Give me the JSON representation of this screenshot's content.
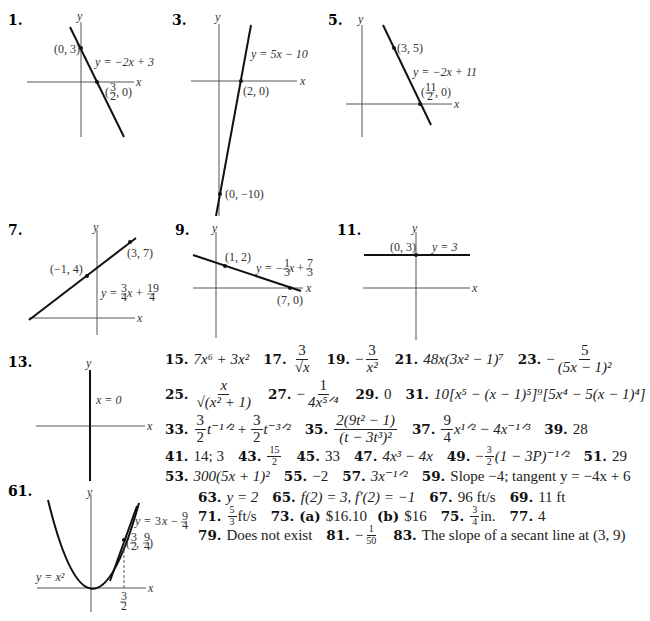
{
  "graphs": [
    {
      "number": "1.",
      "equation": "y = −2x + 3",
      "points": [
        "(0, 3)",
        "(3/2, 0)"
      ],
      "axis_x": "x",
      "axis_y": "y"
    },
    {
      "number": "3.",
      "equation": "y = 5x − 10",
      "points": [
        "(2, 0)",
        "(0, −10)"
      ],
      "axis_x": "x",
      "axis_y": "y"
    },
    {
      "number": "5.",
      "equation": "y = −2x + 11",
      "points": [
        "(3, 5)",
        "(11/2, 0)"
      ],
      "axis_x": "x",
      "axis_y": "y"
    },
    {
      "number": "7.",
      "equation": "y = 3/4 x + 19/4",
      "points": [
        "(−1, 4)",
        "(3, 7)"
      ],
      "axis_x": "x",
      "axis_y": "y"
    },
    {
      "number": "9.",
      "equation": "y = −1/3 x + 7/3",
      "points": [
        "(1, 2)",
        "(7, 0)"
      ],
      "axis_x": "x",
      "axis_y": "y"
    },
    {
      "number": "11.",
      "equation": "y = 3",
      "points": [
        "(0, 3)"
      ],
      "axis_x": "x",
      "axis_y": "y"
    },
    {
      "number": "13.",
      "equation": "x = 0",
      "points": [],
      "axis_x": "x",
      "axis_y": "y"
    },
    {
      "number": "61.",
      "equation": "y = 3x − 9/4",
      "curve": "y = x²",
      "points": [
        "(3/2, 9/4)"
      ],
      "tick": "3/2",
      "axis_x": "x",
      "axis_y": "y"
    }
  ],
  "labels": {
    "g1_pt1": "(0, 3)",
    "g1_eq": "y = −2x + 3",
    "g1_pt2_pre": "(",
    "g1_pt2_post": ", 0)",
    "g3_eq": "y = 5x − 10",
    "g3_pt1": "(2, 0)",
    "g3_pt2": "(0, −10)",
    "g5_pt1": "(3, 5)",
    "g5_eq": "y = −2x + 11",
    "g7_pt1": "(−1, 4)",
    "g7_pt2": "(3, 7)",
    "g9_pt1": "(1, 2)",
    "g9_pt2": "(7, 0)",
    "g11_pt1": "(0, 3)",
    "g11_eq": "y = 3",
    "g13_eq": "x = 0",
    "g61_curve": "y = x²",
    "x": "x",
    "y": "y",
    "n1": "1.",
    "n3": "3.",
    "n5": "5.",
    "n7": "7.",
    "n9": "9.",
    "n11": "11.",
    "n13": "13.",
    "n61": "61."
  },
  "answers": {
    "15": {
      "num": "15.",
      "text": "7x⁶ + 3x²"
    },
    "17": {
      "num": "17.",
      "top": "3",
      "bottom": "√x"
    },
    "19": {
      "num": "19.",
      "sign": "−",
      "top": "3",
      "bottom": "x²"
    },
    "21": {
      "num": "21.",
      "text": "48x(3x² − 1)⁷"
    },
    "23": {
      "num": "23.",
      "sign": "−",
      "top": "5",
      "bottom": "(5x − 1)²"
    },
    "25": {
      "num": "25.",
      "top": "x",
      "bottom": "√(x² + 1)"
    },
    "27": {
      "num": "27.",
      "sign": "−",
      "top": "1",
      "bottom": "4x⁵ᐟ⁴"
    },
    "29": {
      "num": "29.",
      "text": "0"
    },
    "31": {
      "num": "31.",
      "text": "10[x⁵ − (x − 1)⁵]⁹[5x⁴ − 5(x − 1)⁴]"
    },
    "33": {
      "num": "33.",
      "t1": "t⁻¹ᐟ²",
      "plus": " + ",
      "t2": "t⁻³ᐟ²",
      "top": "3",
      "bottom": "2"
    },
    "35": {
      "num": "35.",
      "top": "2(9t² − 1)",
      "bottom": "(t − 3t³)²"
    },
    "37": {
      "num": "37.",
      "top": "9",
      "bottom": "4",
      "rest": "x¹ᐟ² − 4x⁻¹ᐟ³"
    },
    "39": {
      "num": "39.",
      "text": "28"
    },
    "41": {
      "num": "41.",
      "text": "14; 3"
    },
    "43": {
      "num": "43.",
      "top": "15",
      "bottom": "2"
    },
    "45": {
      "num": "45.",
      "text": "33"
    },
    "47": {
      "num": "47.",
      "text": "4x³ − 4x"
    },
    "49": {
      "num": "49.",
      "sign": "−",
      "top": "3",
      "bottom": "2",
      "rest": "(1 − 3P)⁻¹ᐟ²"
    },
    "51": {
      "num": "51.",
      "text": "29"
    },
    "53": {
      "num": "53.",
      "text": "300(5x + 1)²"
    },
    "55": {
      "num": "55.",
      "text": "−2"
    },
    "57": {
      "num": "57.",
      "text": "3x⁻¹ᐟ²"
    },
    "59": {
      "num": "59.",
      "text": "Slope −4; tangent y = −4x + 6"
    },
    "63": {
      "num": "63.",
      "text": "y = 2"
    },
    "65": {
      "num": "65.",
      "text": "f(2) = 3, f′(2) = −1"
    },
    "67": {
      "num": "67.",
      "text": "96 ft/s"
    },
    "69": {
      "num": "69.",
      "text": "11 ft"
    },
    "71": {
      "num": "71.",
      "top": "5",
      "bottom": "3",
      "rest": "ft/s"
    },
    "73": {
      "num": "73.",
      "a_label": "(a)",
      "a": "$16.10",
      "b_label": "(b)",
      "b": "$16"
    },
    "75": {
      "num": "75.",
      "top": "3",
      "bottom": "4",
      "rest": "in."
    },
    "77": {
      "num": "77.",
      "text": "4"
    },
    "79": {
      "num": "79.",
      "text": "Does not exist"
    },
    "81": {
      "num": "81.",
      "sign": "−",
      "top": "1",
      "bottom": "50"
    },
    "83": {
      "num": "83.",
      "text": "The slope of a secant line at (3, 9)"
    }
  },
  "fractions": {
    "three": "3",
    "two": "2",
    "eleven": "11",
    "nine": "9",
    "four": "4",
    "nineteen": "19",
    "one": "1",
    "seven": "7",
    "minus": "−",
    "plus": "+",
    "y_eq": "y =",
    "x_var": "x",
    "comma_zero": ", 0)",
    "open": "(",
    "close": ")",
    "comma": ", "
  }
}
